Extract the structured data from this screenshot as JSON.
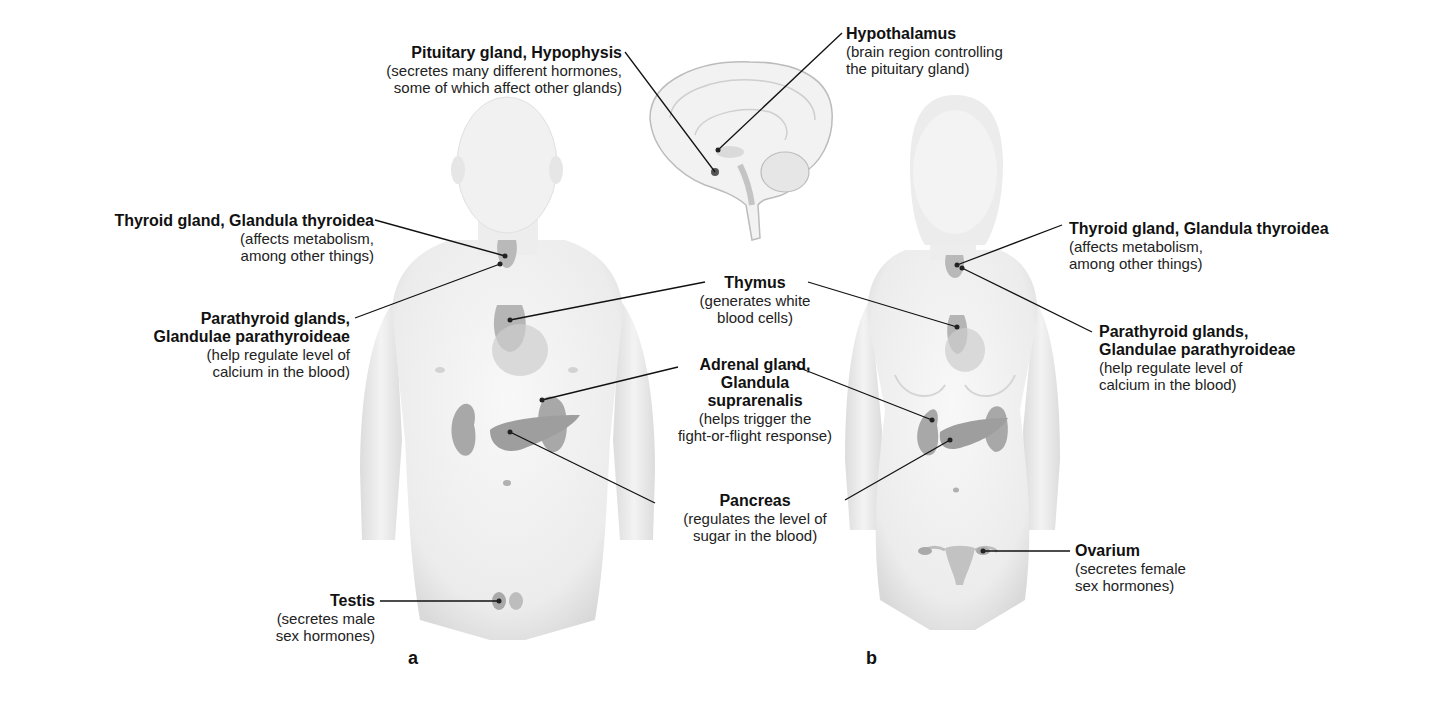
{
  "figure": {
    "panels": [
      {
        "id": "a",
        "label": "a",
        "subject": "male body"
      },
      {
        "id": "b",
        "label": "b",
        "subject": "female body"
      }
    ],
    "colors": {
      "background": "#ffffff",
      "body_fill": "#eeeeee",
      "organ_fill": "#a9a9a9",
      "leader_line": "#111111",
      "text": "#111111"
    }
  },
  "labels": {
    "pituitary": {
      "title": "Pituitary gland, Hypophysis",
      "desc1": "(secretes many different hormones,",
      "desc2": "some of which affect other glands)"
    },
    "hypothalamus": {
      "title": "Hypothalamus",
      "desc1": "(brain region controlling",
      "desc2": "the pituitary gland)"
    },
    "thyroid_a": {
      "title": "Thyroid gland, Glandula thyroidea",
      "desc1": "(affects metabolism,",
      "desc2": "among other things)"
    },
    "parathyroid_a": {
      "title1": "Parathyroid glands,",
      "title2": "Glandulae parathyroideae",
      "desc1": "(help regulate level of",
      "desc2": "calcium in the blood)"
    },
    "thymus": {
      "title": "Thymus",
      "desc1": "(generates white",
      "desc2": "blood cells)"
    },
    "adrenal": {
      "title1": "Adrenal gland,",
      "title2": "Glandula",
      "title3": "suprarenalis",
      "desc1": "(helps trigger the",
      "desc2": "fight-or-flight response)"
    },
    "pancreas": {
      "title": "Pancreas",
      "desc1": "(regulates the level of",
      "desc2": "sugar in the blood)"
    },
    "testis": {
      "title": "Testis",
      "desc1": "(secretes male",
      "desc2": "sex hormones)"
    },
    "thyroid_b": {
      "title": "Thyroid gland, Glandula thyroidea",
      "desc1": "(affects metabolism,",
      "desc2": "among other things)"
    },
    "parathyroid_b": {
      "title1": "Parathyroid glands,",
      "title2": "Glandulae parathyroideae",
      "desc1": "(help regulate level of",
      "desc2": "calcium in the blood)"
    },
    "ovarium": {
      "title": "Ovarium",
      "desc1": "(secretes female",
      "desc2": "sex hormones)"
    }
  }
}
